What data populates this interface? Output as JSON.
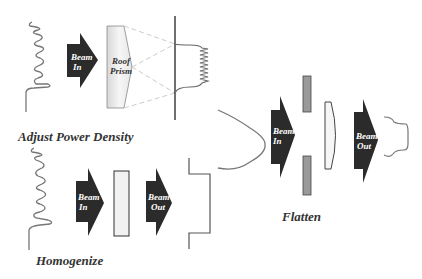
{
  "colors": {
    "arrow_fill": "#2b2b2b",
    "profile_stroke": "#777777",
    "line_stroke": "#444444",
    "dashed_stroke": "#cccccc",
    "aperture_fill": "#9a9a9a",
    "optic_fill": "#f2f2f2",
    "caption_color": "#333333"
  },
  "panels": {
    "adjust_power_density": {
      "caption": "Adjust Power Density",
      "arrow": {
        "line1": "Beam",
        "line2": "In"
      },
      "prism": {
        "line1": "Roof",
        "line2": "Prism"
      }
    },
    "homogenize": {
      "caption": "Homogenize",
      "arrow_in": {
        "line1": "Beam",
        "line2": "In"
      },
      "arrow_out": {
        "line1": "Beam",
        "line2": "Out"
      }
    },
    "flatten": {
      "caption": "Flatten",
      "arrow_in": {
        "line1": "Beam",
        "line2": "In"
      },
      "arrow_out": {
        "line1": "Beam",
        "line2": "Out"
      }
    }
  }
}
